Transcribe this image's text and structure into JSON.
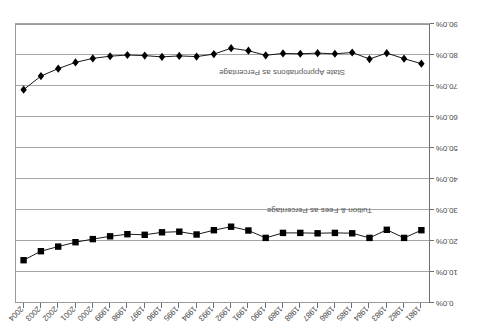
{
  "chart_data": {
    "type": "line",
    "title": "",
    "subtitle": "",
    "xlabel": "",
    "ylabel": "",
    "ylim": [
      0,
      90
    ],
    "y_inverted": true,
    "grid": true,
    "legend": "inline-labels",
    "orientation_note": "figure rendered rotated 180 degrees",
    "categories": [
      "1981",
      "1982",
      "1983",
      "1984",
      "1985",
      "1986",
      "1987",
      "1988",
      "1989",
      "1990",
      "1991",
      "1992",
      "1993",
      "1994",
      "1995",
      "1996",
      "1997",
      "1998",
      "1999",
      "2000",
      "2001",
      "2002",
      "2003",
      "2004"
    ],
    "ytick_labels": [
      "0.0%",
      "10.0%",
      "20.0%",
      "30.0%",
      "40.0%",
      "50.0%",
      "60.0%",
      "70.0%",
      "80.0%",
      "90.0%"
    ],
    "ytick_values": [
      0,
      10,
      20,
      30,
      40,
      50,
      60,
      70,
      80,
      90
    ],
    "series": [
      {
        "name": "Tuition & Fees as Percentage",
        "marker": "square",
        "color": "#000000",
        "label_text": "Tuition & Fees as Percentage",
        "values": [
          23.5,
          21.0,
          23.6,
          21.0,
          22.5,
          22.6,
          22.5,
          22.6,
          22.6,
          21.0,
          23.4,
          24.6,
          23.5,
          22.1,
          23.0,
          22.8,
          22.0,
          22.2,
          21.5,
          20.6,
          19.6,
          18.2,
          16.7,
          13.8
        ]
      },
      {
        "name": "State Appropriations as Percentage",
        "marker": "diamond",
        "color": "#000000",
        "label_text": "State Appropriations as Percentage",
        "values": [
          77.2,
          78.8,
          80.6,
          78.7,
          80.8,
          80.4,
          80.6,
          80.4,
          80.5,
          79.9,
          81.4,
          82.2,
          80.3,
          79.5,
          79.7,
          79.4,
          79.8,
          80.0,
          79.6,
          78.9,
          77.6,
          75.6,
          73.2,
          68.8
        ]
      }
    ]
  },
  "labels": {
    "tuition": "Tuition & Fees as Percentage",
    "state": "State Appropriations as Percentage"
  }
}
